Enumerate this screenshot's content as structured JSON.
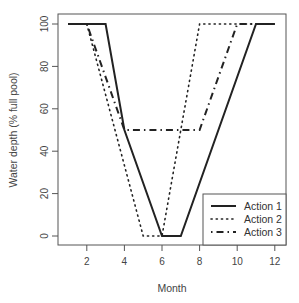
{
  "chart_data": {
    "type": "line",
    "title": "",
    "xlabel": "Month",
    "ylabel": "Water depth (% full pool)",
    "xlim": [
      0.5,
      12.5
    ],
    "ylim": [
      -5,
      105
    ],
    "xticks": [
      2,
      4,
      6,
      8,
      10,
      12
    ],
    "yticks": [
      0,
      20,
      40,
      60,
      80,
      100
    ],
    "grid": false,
    "legend_position": "bottom-right",
    "series": [
      {
        "name": "Action 1",
        "style": "solid",
        "x": [
          1,
          3,
          4,
          6,
          7,
          11,
          12
        ],
        "y": [
          100,
          100,
          50,
          0,
          0,
          100,
          100
        ]
      },
      {
        "name": "Action 2",
        "style": "dotted",
        "x": [
          2,
          5,
          6,
          8,
          12
        ],
        "y": [
          100,
          0,
          0,
          100,
          100
        ]
      },
      {
        "name": "Action 3",
        "style": "dashdot",
        "x": [
          2,
          4,
          8,
          10,
          12
        ],
        "y": [
          100,
          50,
          50,
          100,
          100
        ]
      }
    ]
  },
  "legend": {
    "items": [
      {
        "label": "Action 1"
      },
      {
        "label": "Action 2"
      },
      {
        "label": "Action 3"
      }
    ]
  }
}
